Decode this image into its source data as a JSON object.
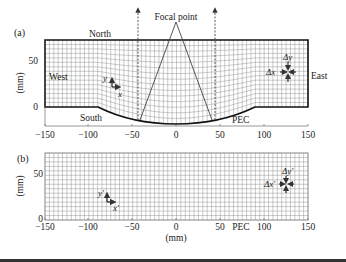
{
  "panel_a": {
    "tag": "(a)",
    "labels": {
      "north": "North",
      "south": "South",
      "west": "West",
      "east": "East",
      "focal": "Focal point",
      "pec": "PEC"
    },
    "axis_y_label": "(mm)",
    "x_ticks": [
      "−150",
      "−100",
      "−50",
      "0",
      "50",
      "100",
      "150"
    ],
    "y_ticks": [
      "0",
      "50"
    ],
    "coord": {
      "y": "y",
      "x": "x"
    },
    "delta": {
      "dy": "Δy",
      "dx": "Δx"
    }
  },
  "panel_b": {
    "tag": "(b)",
    "axis_y_label": "(mm)",
    "axis_x_label": "(mm)",
    "pec": "PEC",
    "x_ticks": [
      "−150",
      "−100",
      "−50",
      "0",
      "50",
      "100",
      "150"
    ],
    "y_ticks": [
      "0",
      "50"
    ],
    "coord": {
      "y": "y′",
      "x": "x′"
    },
    "delta": {
      "dy": "Δy′",
      "dx": "Δx′"
    }
  },
  "colors": {
    "ink": "#222222",
    "grid": "#8a8a8a",
    "border": "#111111",
    "rule": "#333333"
  }
}
